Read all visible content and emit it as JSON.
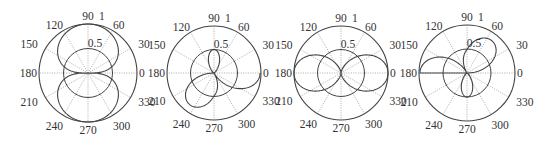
{
  "figure": {
    "colors": {
      "curve": "#444444",
      "grid_circle": "#444444",
      "spoke": "#999999",
      "text": "#333333",
      "background": "#ffffff"
    }
  },
  "chart_data": [
    {
      "type": "line",
      "polar": true,
      "title": "",
      "center": [
        88,
        73
      ],
      "radius_px": 49,
      "rlim": [
        0,
        1
      ],
      "r_ticks": [
        "0.5",
        "1"
      ],
      "theta_ticks": [
        "0",
        "30",
        "60",
        "90",
        "120",
        "150",
        "180",
        "210",
        "240",
        "270",
        "300",
        "330"
      ],
      "pattern": "vertical figure-eight: lobes at 90 and 270 reaching r=1, nulls at 0 and 180",
      "formula": "sqrt(|sin(theta)|)",
      "series": [
        {
          "name": "pattern",
          "peaks": [
            {
              "theta": 90,
              "r": 1.0
            },
            {
              "theta": 270,
              "r": 1.0
            }
          ],
          "nulls": [
            0,
            180
          ]
        }
      ]
    },
    {
      "type": "line",
      "polar": true,
      "title": "",
      "center": [
        214,
        73
      ],
      "radius_px": 47,
      "rlim": [
        0,
        1
      ],
      "r_ticks": [
        "0.5",
        "1"
      ],
      "theta_ticks": [
        "0",
        "30",
        "60",
        "90",
        "120",
        "150",
        "180",
        "210",
        "240",
        "270",
        "300",
        "330"
      ],
      "pattern": "small lobe up at 90 (r~0.5); two large lobes down at ~210 and ~330 (r~1); nulls at 0 and 180",
      "series": [
        {
          "name": "pattern",
          "peaks": [
            {
              "theta": 90,
              "r": 0.5
            },
            {
              "theta": 205,
              "r": 1.0
            },
            {
              "theta": 335,
              "r": 1.0
            }
          ],
          "nulls": [
            0,
            180
          ],
          "dip": {
            "theta": 270,
            "r": 0.62
          }
        }
      ]
    },
    {
      "type": "line",
      "polar": true,
      "title": "",
      "center": [
        341,
        73
      ],
      "radius_px": 47,
      "rlim": [
        0,
        1
      ],
      "r_ticks": [
        "0.5",
        "1"
      ],
      "theta_ticks": [
        "0",
        "30",
        "60",
        "90",
        "120",
        "150",
        "180",
        "210",
        "240",
        "270",
        "300",
        "330"
      ],
      "pattern": "horizontal figure-eight: lobes at 0 and 180 reaching r=1, nulls at 90 and 270",
      "formula": "cos(theta)^2",
      "series": [
        {
          "name": "pattern",
          "peaks": [
            {
              "theta": 0,
              "r": 1.0
            },
            {
              "theta": 180,
              "r": 1.0
            }
          ],
          "nulls": [
            90,
            270
          ]
        }
      ]
    },
    {
      "type": "line",
      "polar": true,
      "title": "",
      "center": [
        467,
        73
      ],
      "radius_px": 48,
      "rlim": [
        0,
        1
      ],
      "r_ticks": [
        "0.5",
        "1"
      ],
      "theta_ticks": [
        "0",
        "30",
        "60",
        "90",
        "120",
        "150",
        "180",
        "210",
        "240",
        "270",
        "300",
        "330"
      ],
      "pattern": "mirror of plot 2: small lobe down at 270 (r~0.5); two large lobes up at ~25 and ~155 (r~1); nulls at 0 and 180",
      "series": [
        {
          "name": "pattern",
          "peaks": [
            {
              "theta": 270,
              "r": 0.5
            },
            {
              "theta": 155,
              "r": 1.0
            },
            {
              "theta": 25,
              "r": 1.0
            }
          ],
          "nulls": [
            0,
            180
          ],
          "dip": {
            "theta": 90,
            "r": 0.55
          }
        }
      ]
    }
  ]
}
